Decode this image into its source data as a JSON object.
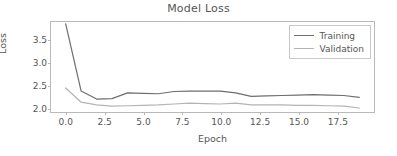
{
  "chart_data": {
    "type": "line",
    "title": "Model Loss",
    "xlabel": "Epoch",
    "ylabel": "Loss",
    "grid": false,
    "legend_position": "upper right",
    "xlim": [
      -0.95,
      19.95
    ],
    "ylim": [
      1.88,
      3.9
    ],
    "xticks": [
      0.0,
      2.5,
      5.0,
      7.5,
      10.0,
      12.5,
      15.0,
      17.5
    ],
    "xtick_labels": [
      "0.0",
      "2.5",
      "5.0",
      "7.5",
      "10.0",
      "12.5",
      "15.0",
      "17.5"
    ],
    "yticks": [
      2.0,
      2.5,
      3.0,
      3.5
    ],
    "ytick_labels": [
      "2.0",
      "2.5",
      "3.0",
      "3.5"
    ],
    "x": [
      0,
      1,
      2,
      3,
      4,
      5,
      6,
      7,
      8,
      9,
      10,
      11,
      12,
      13,
      14,
      15,
      16,
      17,
      18,
      19
    ],
    "series": [
      {
        "name": "Training",
        "color": "#6e6e6e",
        "values": [
          3.86,
          2.35,
          2.17,
          2.18,
          2.31,
          2.3,
          2.29,
          2.34,
          2.35,
          2.35,
          2.35,
          2.31,
          2.23,
          2.24,
          2.25,
          2.26,
          2.27,
          2.26,
          2.25,
          2.21
        ]
      },
      {
        "name": "Validation",
        "color": "#b4b4b4",
        "values": [
          2.42,
          2.1,
          2.04,
          2.01,
          2.02,
          2.03,
          2.04,
          2.06,
          2.08,
          2.07,
          2.06,
          2.08,
          2.04,
          2.04,
          2.04,
          2.03,
          2.03,
          2.02,
          2.01,
          1.97
        ]
      }
    ]
  },
  "legend": {
    "entries": [
      {
        "label": "Training",
        "color": "#6e6e6e"
      },
      {
        "label": "Validation",
        "color": "#b4b4b4"
      }
    ]
  }
}
